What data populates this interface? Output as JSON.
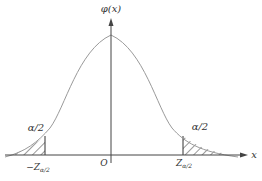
{
  "diagram": {
    "type": "normal-distribution-two-tailed",
    "y_axis_label": "φ(x)",
    "x_axis_label": "x",
    "origin_label": "O",
    "left_tail_label": "α/2",
    "right_tail_label": "α/2",
    "left_cutoff_label": "−Z",
    "left_cutoff_sub": "α/2",
    "right_cutoff_label": "Z",
    "right_cutoff_sub": "α/2",
    "colors": {
      "curve": "#9a9a9a",
      "axis": "#444444",
      "hatch": "#333333"
    }
  }
}
